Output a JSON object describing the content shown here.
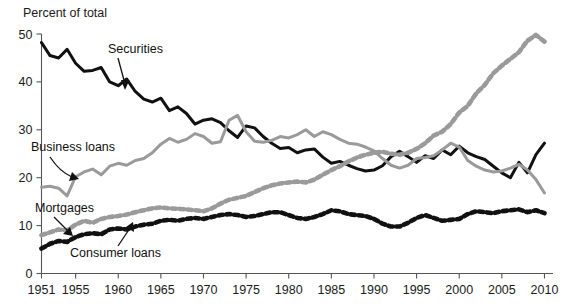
{
  "figure": {
    "y_axis_title": "Percent of total",
    "background_color": "#ffffff"
  },
  "chart_data": {
    "type": "line",
    "title": "",
    "subtitle": "",
    "xlabel": "",
    "ylabel": "Percent of total",
    "xlim": [
      1951,
      2011
    ],
    "ylim": [
      0,
      50
    ],
    "grid": false,
    "legend_position": "inline-annotations",
    "y_ticks": [
      0,
      10,
      20,
      30,
      40,
      50
    ],
    "x_ticks": [
      1951,
      1955,
      1960,
      1965,
      1970,
      1975,
      1980,
      1985,
      1990,
      1995,
      2000,
      2005,
      2010
    ],
    "x": [
      1951,
      1952,
      1953,
      1954,
      1955,
      1956,
      1957,
      1958,
      1959,
      1960,
      1961,
      1962,
      1963,
      1964,
      1965,
      1966,
      1967,
      1968,
      1969,
      1970,
      1971,
      1972,
      1973,
      1974,
      1975,
      1976,
      1977,
      1978,
      1979,
      1980,
      1981,
      1982,
      1983,
      1984,
      1985,
      1986,
      1987,
      1988,
      1989,
      1990,
      1991,
      1992,
      1993,
      1994,
      1995,
      1996,
      1997,
      1998,
      1999,
      2000,
      2001,
      2002,
      2003,
      2004,
      2005,
      2006,
      2007,
      2008,
      2009,
      2010
    ],
    "series": [
      {
        "name": "Securities",
        "color": "#111111",
        "style": "solid",
        "label_anchor_year": 1963,
        "values": [
          48.2,
          45.5,
          45.0,
          46.8,
          43.9,
          42.2,
          42.4,
          43.0,
          40.0,
          39.2,
          40.6,
          38.0,
          36.4,
          35.8,
          36.6,
          34.0,
          34.8,
          33.4,
          31.2,
          32.0,
          32.3,
          31.5,
          29.8,
          28.4,
          30.8,
          30.4,
          28.6,
          27.2,
          26.1,
          26.3,
          25.2,
          25.8,
          26.0,
          24.3,
          23.0,
          23.4,
          22.6,
          21.9,
          21.4,
          21.6,
          22.5,
          24.4,
          25.5,
          24.4,
          23.2,
          24.6,
          24.0,
          25.8,
          24.8,
          26.6,
          25.2,
          24.4,
          23.8,
          22.4,
          21.0,
          20.0,
          23.2,
          21.0,
          24.8,
          27.2
        ]
      },
      {
        "name": "Business loans",
        "color": "#9a9a9a",
        "style": "solid",
        "label_anchor_year": 1957,
        "values": [
          18.0,
          18.2,
          17.8,
          16.2,
          20.2,
          21.2,
          21.8,
          20.6,
          22.4,
          23.0,
          22.6,
          23.6,
          24.0,
          25.2,
          27.0,
          28.2,
          27.4,
          28.0,
          29.2,
          28.6,
          27.2,
          27.5,
          32.0,
          33.0,
          29.6,
          27.6,
          27.4,
          27.8,
          28.6,
          28.3,
          29.0,
          30.0,
          28.6,
          29.6,
          29.0,
          28.0,
          27.2,
          27.0,
          26.4,
          25.6,
          24.0,
          22.6,
          22.0,
          22.6,
          24.0,
          24.2,
          24.6,
          25.8,
          27.2,
          26.4,
          23.6,
          22.4,
          21.6,
          21.2,
          21.4,
          22.0,
          22.8,
          21.6,
          19.6,
          16.8
        ]
      },
      {
        "name": "Mortgages",
        "color": "#9a9a9a",
        "style": "dotted",
        "label_anchor_year": 1957,
        "values": [
          8.0,
          8.6,
          9.2,
          9.0,
          10.2,
          11.0,
          10.6,
          11.4,
          11.8,
          12.0,
          12.3,
          12.8,
          13.2,
          13.6,
          13.8,
          13.6,
          13.5,
          13.4,
          13.2,
          13.0,
          13.6,
          14.6,
          15.4,
          15.8,
          16.2,
          17.0,
          17.8,
          18.4,
          18.8,
          19.0,
          19.2,
          19.0,
          19.6,
          20.6,
          21.6,
          22.4,
          23.4,
          24.2,
          24.8,
          25.2,
          25.4,
          25.0,
          24.8,
          25.2,
          26.0,
          27.2,
          28.8,
          29.6,
          31.2,
          33.6,
          35.0,
          37.6,
          39.4,
          41.8,
          43.4,
          44.8,
          46.2,
          48.6,
          49.8,
          48.4
        ]
      },
      {
        "name": "Consumer loans",
        "color": "#111111",
        "style": "dotted",
        "label_anchor_year": 1961,
        "values": [
          5.2,
          6.2,
          6.8,
          6.6,
          7.6,
          8.2,
          8.4,
          8.2,
          9.2,
          9.4,
          9.2,
          9.8,
          10.2,
          10.4,
          11.0,
          11.2,
          11.0,
          11.4,
          11.6,
          11.4,
          11.8,
          12.2,
          12.4,
          12.2,
          11.8,
          12.0,
          12.4,
          12.8,
          12.8,
          12.2,
          11.6,
          11.4,
          11.8,
          12.4,
          13.2,
          13.0,
          12.4,
          12.2,
          12.0,
          11.4,
          10.4,
          9.8,
          9.8,
          10.6,
          11.6,
          12.2,
          11.6,
          11.0,
          11.2,
          11.4,
          12.4,
          13.0,
          12.8,
          12.6,
          13.0,
          13.2,
          13.4,
          12.8,
          13.2,
          12.6
        ]
      }
    ]
  },
  "annotations": [
    {
      "id": "securities",
      "text": "Securities",
      "x": 108,
      "y": 53
    },
    {
      "id": "business-loans",
      "text": "Business loans",
      "x": 31,
      "y": 151
    },
    {
      "id": "mortgages",
      "text": "Mortgages",
      "x": 35,
      "y": 212
    },
    {
      "id": "consumer-loans",
      "text": "Consumer loans",
      "x": 70,
      "y": 257
    }
  ]
}
